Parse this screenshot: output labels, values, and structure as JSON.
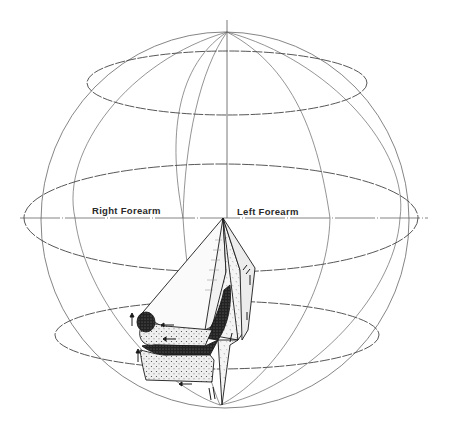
{
  "figure": {
    "type": "globe-diagram",
    "labels": {
      "right": "Right Forearm",
      "left": "Left Forearm"
    },
    "colors": {
      "background": "#ffffff",
      "line": "#555555",
      "ink": "#1a1a1a",
      "stipple_light": "#e8e8e8",
      "stipple_dark": "#2a2a2a"
    },
    "sphere": {
      "cx": 225,
      "cy": 220,
      "r": 187
    },
    "latitudes": [
      {
        "name": "upper",
        "cx": 227,
        "cy": 83,
        "rx": 140,
        "ry": 32
      },
      {
        "name": "equator",
        "cx": 221,
        "cy": 218,
        "rx": 197,
        "ry": 54
      },
      {
        "name": "lower",
        "cx": 217,
        "cy": 335,
        "rx": 162,
        "ry": 34
      }
    ]
  }
}
